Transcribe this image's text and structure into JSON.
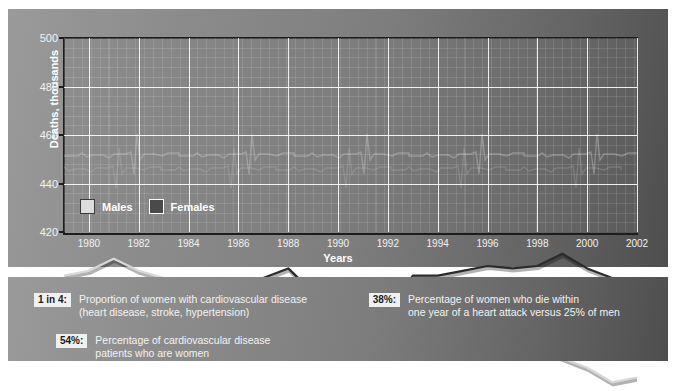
{
  "chart_data": {
    "type": "line",
    "title": "",
    "xlabel": "Years",
    "ylabel": "Deaths, thousands",
    "xlim": [
      1979,
      2002
    ],
    "ylim": [
      420,
      500
    ],
    "yticks": [
      420,
      440,
      460,
      480,
      500
    ],
    "xticks": [
      1980,
      1982,
      1984,
      1986,
      1988,
      1990,
      1992,
      1994,
      1996,
      1998,
      2000,
      2002
    ],
    "grid": true,
    "legend_position": "inside-bottom-left",
    "x": [
      1979,
      1980,
      1981,
      1982,
      1983,
      1984,
      1985,
      1986,
      1987,
      1988,
      1989,
      1990,
      1991,
      1992,
      1993,
      1994,
      1995,
      1996,
      1997,
      1998,
      1999,
      2000,
      2001,
      2002
    ],
    "series": [
      {
        "name": "Females",
        "color": "#2b2b2b",
        "values": [
          458,
          472,
          473,
          470,
          470,
          470,
          473,
          477,
          481,
          485,
          475,
          466,
          466,
          466,
          482,
          482,
          484,
          486,
          485,
          486,
          491,
          485,
          481,
          479
        ]
      },
      {
        "name": "Males",
        "color": "#d8d8d8",
        "values": [
          482,
          484,
          489,
          484,
          481,
          478,
          477,
          476,
          476,
          479,
          474,
          470,
          468,
          463,
          462,
          462,
          459,
          458,
          456,
          452,
          448,
          444,
          438,
          440
        ]
      }
    ]
  },
  "chart": {
    "legend": [
      {
        "label": "Males",
        "swatch": "males"
      },
      {
        "label": "Females",
        "swatch": "females"
      }
    ]
  },
  "facts": {
    "left": [
      {
        "badge": "1 in 4:",
        "line1": "Proportion of women with cardiovascular disease",
        "line2": "(heart disease, stroke, hypertension)"
      },
      {
        "badge": "54%:",
        "line1": "Percentage of cardiovascular disease",
        "line2": "patients who are women"
      }
    ],
    "right": [
      {
        "badge": "38%:",
        "line1": "Percentage of women who die within",
        "line2": "one year of a heart attack versus 25% of men"
      }
    ]
  }
}
